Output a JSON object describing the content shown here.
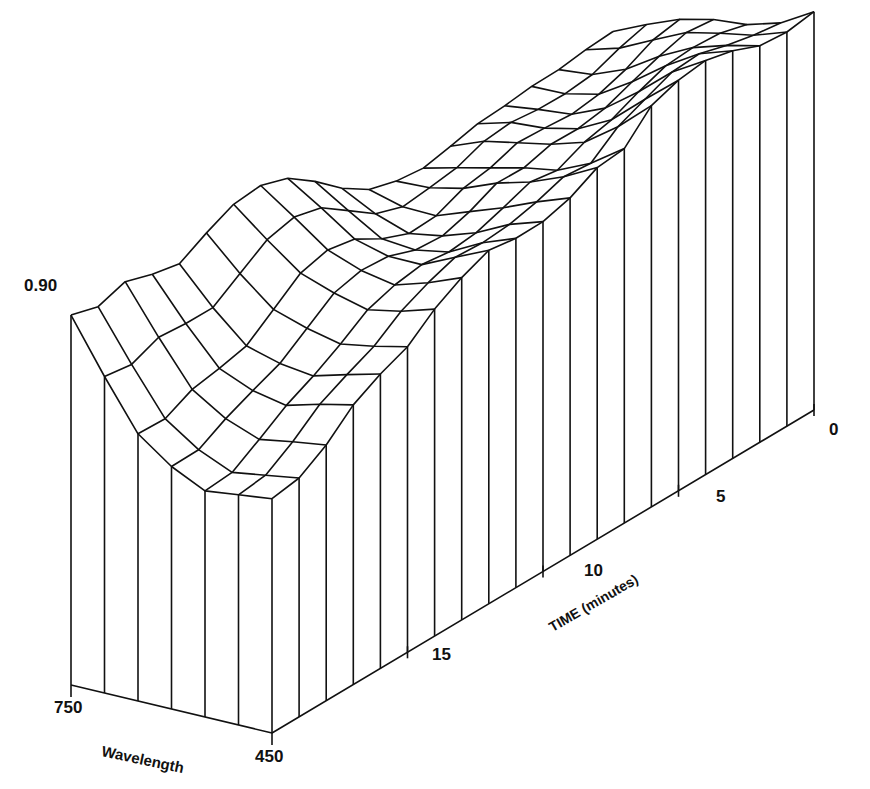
{
  "chart_data": {
    "type": "surface3d-wireframe",
    "title": "",
    "z_label_tick": "0.90",
    "x_axis": {
      "label": "Wavelength",
      "ticks": [
        "750",
        "450"
      ],
      "range": [
        750,
        450
      ],
      "steps": 6
    },
    "y_axis": {
      "label": "TIME (minutes)",
      "ticks": [
        "15",
        "10",
        "5",
        "0"
      ],
      "range": [
        20,
        0
      ],
      "steps": 20
    },
    "z_axis": {
      "ticks": [
        "0.90"
      ],
      "max_label_value": 0.9
    },
    "wavelength_nm": [
      750,
      700,
      650,
      600,
      550,
      500,
      450
    ],
    "time_min": [
      20,
      19,
      18,
      17,
      16,
      15,
      14,
      13,
      12,
      11,
      10,
      9,
      8,
      7,
      6,
      5,
      4,
      3,
      2,
      1,
      0
    ],
    "profile_at_latest_time": [
      0.9,
      0.77,
      0.65,
      0.59,
      0.55,
      0.56,
      0.57
    ],
    "edge_450nm_vs_time": [
      0.57,
      0.58,
      0.62,
      0.68,
      0.72,
      0.75,
      0.8,
      0.83,
      0.85,
      0.84,
      0.85,
      0.88,
      0.92,
      0.92,
      0.97,
      0.98,
      0.99,
      0.99,
      0.98,
      0.98,
      0.98
    ],
    "edge_750nm_vs_time": [
      0.9,
      0.88,
      0.9,
      0.88,
      0.87,
      0.91,
      0.94,
      0.94,
      0.91,
      0.86,
      0.81,
      0.78,
      0.77,
      0.76,
      0.76,
      0.76,
      0.76,
      0.78,
      0.8,
      0.82,
      0.82
    ]
  },
  "labels": {
    "z_tick": "0.90",
    "w_750": "750",
    "w_450": "450",
    "w_title": "Wavelength",
    "t_0": "0",
    "t_5": "5",
    "t_10": "10",
    "t_15": "15",
    "t_title": "TIME (minutes)"
  }
}
